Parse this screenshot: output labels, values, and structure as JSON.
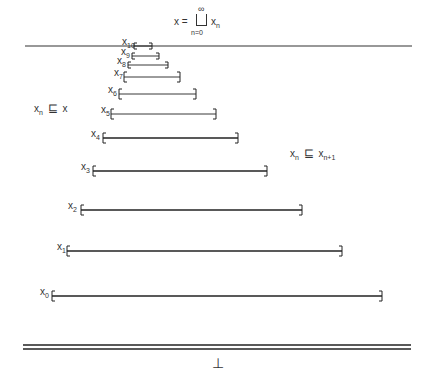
{
  "diagram": {
    "title_formula": {
      "lhs": "x =",
      "operator": "⊔",
      "upper": "∞",
      "lower": "n=0",
      "rhs": "x",
      "rhs_sub": "n"
    },
    "annotations": {
      "left": {
        "var": "x",
        "sub": "n",
        "rel": "⊑",
        "rhs": "x"
      },
      "right": {
        "var": "x",
        "sub": "n",
        "rel": "⊑",
        "rhs": "x",
        "rhs_sub": "n+1"
      }
    },
    "bottom_symbol": "⊥",
    "top_line": {
      "x1": 25,
      "x2": 412,
      "y": 46
    },
    "bottom_double_line": {
      "x1": 23,
      "x2": 411,
      "y1": 345,
      "y2": 349
    },
    "intervals": [
      {
        "label": "x",
        "sub": "0",
        "lx": 40,
        "x1": 52,
        "x2": 382,
        "y": 296
      },
      {
        "label": "x",
        "sub": "1",
        "lx": 57,
        "x1": 67,
        "x2": 342,
        "y": 251
      },
      {
        "label": "x",
        "sub": "2",
        "lx": 68,
        "x1": 81,
        "x2": 302,
        "y": 210
      },
      {
        "label": "x",
        "sub": "3",
        "lx": 81,
        "x1": 93,
        "x2": 267,
        "y": 171
      },
      {
        "label": "x",
        "sub": "4",
        "lx": 91,
        "x1": 103,
        "x2": 238,
        "y": 138
      },
      {
        "label": "x",
        "sub": "5",
        "lx": 101,
        "x1": 111,
        "x2": 216,
        "y": 114
      },
      {
        "label": "x",
        "sub": "6",
        "lx": 108,
        "x1": 119,
        "x2": 196,
        "y": 94
      },
      {
        "label": "x",
        "sub": "7",
        "lx": 114,
        "x1": 124,
        "x2": 180,
        "y": 77
      },
      {
        "label": "x",
        "sub": "8",
        "lx": 117,
        "x1": 128,
        "x2": 168,
        "y": 65
      },
      {
        "label": "x",
        "sub": "9",
        "lx": 121,
        "x1": 132,
        "x2": 159,
        "y": 56
      },
      {
        "label": "x",
        "sub": "10",
        "lx": 122,
        "x1": 134,
        "x2": 152,
        "y": 46
      }
    ]
  }
}
